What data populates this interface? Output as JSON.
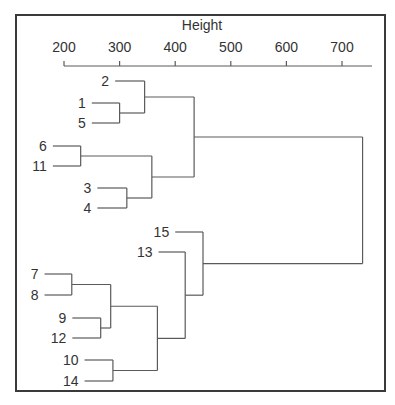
{
  "chart_data": {
    "type": "dendrogram",
    "title": "",
    "xlabel": "Height",
    "axis": {
      "position": "top",
      "ticks": [
        200,
        300,
        400,
        500,
        600,
        700
      ],
      "range": [
        200,
        755
      ]
    },
    "leaf_order": [
      "2",
      "1",
      "5",
      "6",
      "11",
      "3",
      "4",
      "15",
      "13",
      "7",
      "8",
      "9",
      "12",
      "10",
      "14"
    ],
    "merges": [
      {
        "id": "m_7_8",
        "left": "7",
        "right": "8",
        "height": 214
      },
      {
        "id": "m_6_11",
        "left": "6",
        "right": "11",
        "height": 230
      },
      {
        "id": "m_9_12",
        "left": "9",
        "right": "12",
        "height": 266
      },
      {
        "id": "m_78_912",
        "left": "m_7_8",
        "right": "m_9_12",
        "height": 284
      },
      {
        "id": "m_10_14",
        "left": "10",
        "right": "14",
        "height": 288
      },
      {
        "id": "m_1_5",
        "left": "1",
        "right": "5",
        "height": 300
      },
      {
        "id": "m_3_4",
        "left": "3",
        "right": "4",
        "height": 313
      },
      {
        "id": "m_2_15",
        "left": "2",
        "right": "m_1_5",
        "height": 345
      },
      {
        "id": "m_611_34",
        "left": "m_6_11",
        "right": "m_3_4",
        "height": 358
      },
      {
        "id": "m_low",
        "left": "m_78_912",
        "right": "m_10_14",
        "height": 368
      },
      {
        "id": "m_13_low",
        "left": "13",
        "right": "m_low",
        "height": 418
      },
      {
        "id": "m_top",
        "left": "m_2_15",
        "right": "m_611_34",
        "height": 434
      },
      {
        "id": "m_15_rest",
        "left": "15",
        "right": "m_13_low",
        "height": 450
      },
      {
        "id": "root",
        "left": "m_top",
        "right": "m_15_rest",
        "height": 737
      }
    ],
    "leaf_heights": {
      "2": 292,
      "1": 250,
      "5": 250,
      "6": 180,
      "11": 180,
      "3": 260,
      "4": 260,
      "15": 400,
      "13": 370,
      "7": 165,
      "8": 165,
      "9": 215,
      "12": 215,
      "10": 237,
      "14": 237
    },
    "grid": false,
    "legend": null
  },
  "colors": {
    "line": "#5a5a5a",
    "frame": "#3a3a3a",
    "text": "#333333",
    "background": "#ffffff"
  }
}
